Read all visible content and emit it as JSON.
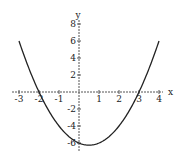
{
  "chart_data": {
    "type": "line",
    "title": "",
    "xlabel": "x",
    "ylabel": "y",
    "function": "y = x^2 - x - 6",
    "xlim": [
      -3,
      4
    ],
    "ylim": [
      -6.25,
      8
    ],
    "x_ticks": [
      -3,
      -2,
      -1,
      1,
      2,
      3,
      4
    ],
    "x_tick_labels": [
      "-3",
      "-2",
      "-1",
      "1",
      "2",
      "3",
      "4"
    ],
    "y_ticks": [
      8,
      6,
      4,
      2,
      -2,
      -4,
      -6
    ],
    "y_tick_labels": [
      "8",
      "6",
      "4",
      "2",
      "-2",
      "-4",
      "-6"
    ],
    "grid": false,
    "legend": null,
    "series": [
      {
        "name": "parabola",
        "x": [
          -3,
          -2.5,
          -2,
          -1.5,
          -1,
          -0.5,
          0,
          0.5,
          1,
          1.5,
          2,
          2.5,
          3,
          3.5,
          4
        ],
        "y": [
          6,
          2.75,
          0,
          -2.25,
          -4,
          -5.25,
          -6,
          -6.25,
          -6,
          -5.25,
          -4,
          -2.25,
          0,
          2.75,
          6
        ]
      }
    ],
    "roots": [
      -2,
      3
    ],
    "vertex": [
      0.5,
      -6.25
    ],
    "line_color": "#222222",
    "axis_color": "#555555"
  },
  "layout": {
    "origin_px": [
      79,
      92
    ],
    "x_unit_px": 20,
    "y_unit_px": 8.5,
    "x_axis_px": [
      12,
      163
    ],
    "y_axis_px": [
      20,
      152
    ]
  }
}
